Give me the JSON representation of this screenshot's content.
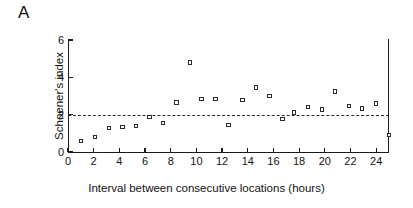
{
  "figure": {
    "panel_label": "A"
  },
  "chart_data": {
    "type": "scatter",
    "title": "",
    "xlabel": "Interval between consecutive locations (hours)",
    "ylabel": "Schoener's index",
    "xlim": [
      0,
      25
    ],
    "ylim": [
      0,
      6
    ],
    "xticks": [
      0,
      2,
      4,
      6,
      8,
      10,
      12,
      14,
      16,
      18,
      20,
      22,
      24
    ],
    "yticks": [
      0,
      2,
      4,
      6
    ],
    "xtick_labels": [
      "0",
      "2",
      "4",
      "6",
      "8",
      "10",
      "12",
      "14",
      "16",
      "18",
      "20",
      "22",
      "24"
    ],
    "ytick_labels": [
      "0",
      "2",
      "4",
      "6"
    ],
    "grid": false,
    "legend": null,
    "marker_style": "open-square",
    "marker_color": "#2a2a2a",
    "reference_line": {
      "orientation": "horizontal",
      "value": 2.0,
      "style": "dashed",
      "color": "#2b2b2b"
    },
    "x": [
      1.0,
      2.1,
      3.2,
      4.25,
      5.3,
      6.35,
      7.4,
      8.45,
      9.5,
      10.4,
      11.5,
      12.5,
      13.6,
      14.65,
      15.7,
      16.7,
      17.6,
      18.7,
      19.8,
      20.8,
      21.9,
      22.9,
      24.0,
      25.0
    ],
    "y": [
      0.6,
      0.8,
      1.28,
      1.33,
      1.4,
      1.88,
      1.55,
      2.65,
      4.8,
      2.85,
      2.85,
      1.45,
      2.78,
      3.45,
      3.0,
      1.78,
      2.12,
      2.4,
      2.28,
      3.25,
      2.48,
      2.33,
      2.6,
      0.9
    ],
    "points": [
      {
        "x": 1.0,
        "y": 0.6
      },
      {
        "x": 2.1,
        "y": 0.8
      },
      {
        "x": 3.2,
        "y": 1.28
      },
      {
        "x": 4.25,
        "y": 1.33
      },
      {
        "x": 5.3,
        "y": 1.4
      },
      {
        "x": 6.35,
        "y": 1.88
      },
      {
        "x": 7.4,
        "y": 1.55
      },
      {
        "x": 8.45,
        "y": 2.65
      },
      {
        "x": 9.5,
        "y": 4.8
      },
      {
        "x": 10.4,
        "y": 2.85
      },
      {
        "x": 11.5,
        "y": 2.85
      },
      {
        "x": 12.5,
        "y": 1.45
      },
      {
        "x": 13.6,
        "y": 2.78
      },
      {
        "x": 14.65,
        "y": 3.45
      },
      {
        "x": 15.7,
        "y": 3.0
      },
      {
        "x": 16.7,
        "y": 1.78
      },
      {
        "x": 17.6,
        "y": 2.12
      },
      {
        "x": 18.7,
        "y": 2.4
      },
      {
        "x": 19.8,
        "y": 2.28
      },
      {
        "x": 20.8,
        "y": 3.25
      },
      {
        "x": 21.9,
        "y": 2.48
      },
      {
        "x": 22.9,
        "y": 2.33
      },
      {
        "x": 24.0,
        "y": 2.6
      },
      {
        "x": 25.0,
        "y": 0.9
      }
    ]
  }
}
